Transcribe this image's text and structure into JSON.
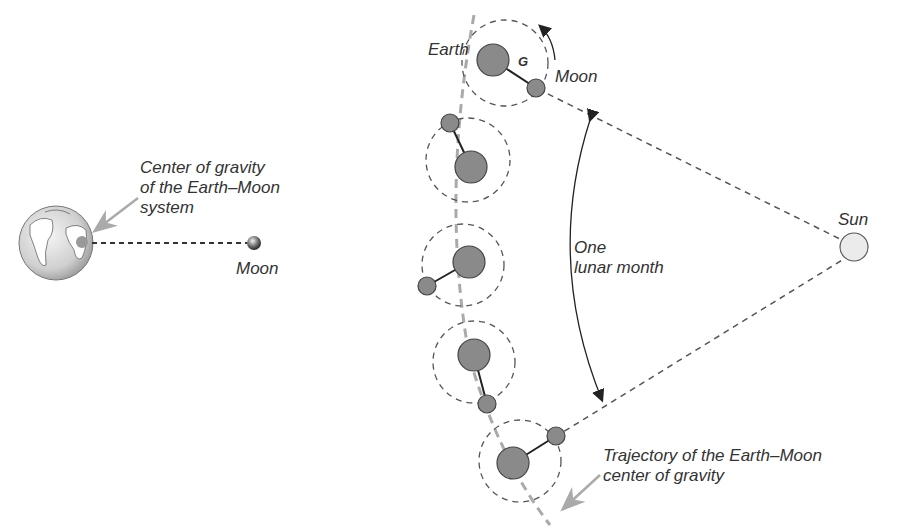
{
  "left_panel": {
    "earth_label": "",
    "moon_label": "Moon",
    "cog_label_lines": [
      "Center of gravity",
      "of the Earth–Moon",
      "system"
    ]
  },
  "right_panel": {
    "earth_label": "Earth",
    "g_label": "G",
    "moon_label": "Moon",
    "sun_label": "Sun",
    "month_label_lines": [
      "One",
      "lunar month"
    ],
    "trajectory_label_lines": [
      "Trajectory of the Earth–Moon",
      "center of gravity"
    ]
  },
  "colors": {
    "body_fill": "#8a8a8a",
    "outline": "#444444",
    "dashed": "#555555",
    "trajectory": "#aaaaaa",
    "sun_fill": "#ebebeb",
    "text": "#333333"
  }
}
